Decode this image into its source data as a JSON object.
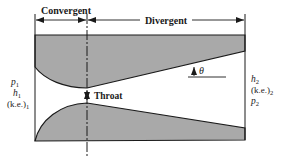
{
  "figure": {
    "colors": {
      "background": "#ffffff",
      "wall_fill": "#a9a9a9",
      "line": "#1a1a1a"
    }
  },
  "sections": {
    "convergent_label": "Convergent",
    "divergent_label": "Divergent"
  },
  "throat": {
    "label": "Throat"
  },
  "angle": {
    "symbol": "θ"
  },
  "inlet": {
    "pressure": "p",
    "pressure_sub": "1",
    "enthalpy": "h",
    "enthalpy_sub": "1",
    "kinetic_energy": "(k.e.)",
    "kinetic_energy_sub": "1"
  },
  "outlet": {
    "enthalpy": "h",
    "enthalpy_sub": "2",
    "kinetic_energy": "(k.e.)",
    "kinetic_energy_sub": "2",
    "pressure": "p",
    "pressure_sub": "2"
  }
}
